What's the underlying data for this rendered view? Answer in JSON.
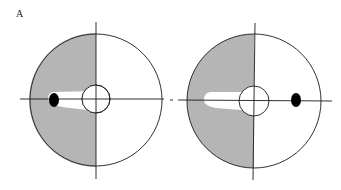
{
  "figure": {
    "panel_label": "A",
    "colors": {
      "background": "#ffffff",
      "shaded_half": "#b5b5b5",
      "stroke": "#1a1a1a",
      "marker": "#000000",
      "cleared_band": "#ffffff"
    },
    "diagrams": [
      {
        "name": "left-diagram",
        "description": "Left half shaded; black marker on left horizontal axis inside shaded region; white band from marker toward center",
        "marker_side": "left"
      },
      {
        "name": "right-diagram",
        "description": "Left half shaded; white band on left extending toward center; black marker on right horizontal axis in unshaded region",
        "marker_side": "right"
      }
    ]
  }
}
